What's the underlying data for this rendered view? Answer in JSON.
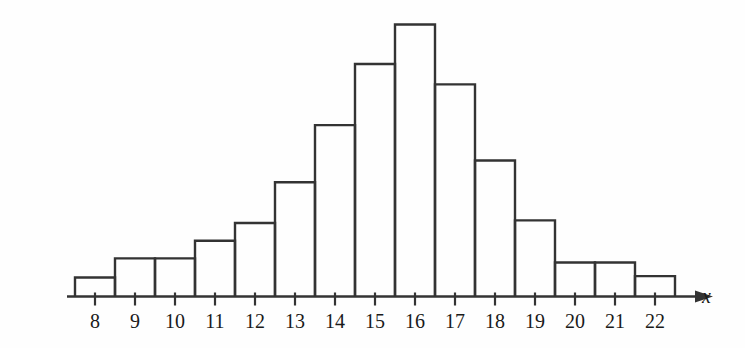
{
  "chart_data": {
    "type": "bar",
    "title": "",
    "subtitle": "",
    "xlabel": "x",
    "ylabel": "",
    "grid": false,
    "legend": null,
    "categories": [
      "8",
      "9",
      "10",
      "11",
      "12",
      "13",
      "14",
      "15",
      "16",
      "17",
      "18",
      "19",
      "20",
      "21",
      "22"
    ],
    "x": [
      8,
      9,
      10,
      11,
      12,
      13,
      14,
      15,
      16,
      17,
      18,
      19,
      20,
      21,
      22
    ],
    "values": [
      1.4,
      2.8,
      2.8,
      4.1,
      5.4,
      8.4,
      12.6,
      17.1,
      20.0,
      15.6,
      10.0,
      5.6,
      2.5,
      2.5,
      1.5
    ],
    "xlim": [
      7.3,
      23.4
    ],
    "ylim": [
      0,
      21.5
    ],
    "bin_width": 1,
    "bar_style": "outline",
    "annotations": [],
    "axis_arrow": true
  },
  "axis": {
    "x_label": "x",
    "tick_labels": [
      "8",
      "9",
      "10",
      "11",
      "12",
      "13",
      "14",
      "15",
      "16",
      "17",
      "18",
      "19",
      "20",
      "21",
      "22"
    ]
  },
  "colors": {
    "line": "#333333",
    "text": "#1a1a1a",
    "background": "#fefefe"
  }
}
